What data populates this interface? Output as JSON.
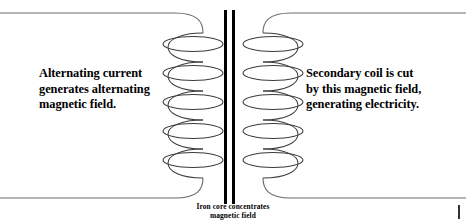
{
  "figure": {
    "type": "transformer-diagram",
    "background_color": "#ffffff",
    "annotations": {
      "primary": {
        "lines": [
          "Alternating current",
          "generates alternating",
          "magnetic field."
        ]
      },
      "secondary": {
        "lines": [
          "Secondary coil is cut",
          "by this magnetic field,",
          "generating electricity."
        ]
      },
      "core_caption": {
        "lines": [
          "Iron core concentrates",
          "magnetic field"
        ]
      }
    },
    "parts": {
      "primary_coil_label": "primary-coil",
      "secondary_coil_label": "secondary-coil",
      "iron_core_label": "iron-core",
      "top_lead_label": "top-wire-lead",
      "bottom_lead_label": "bottom-wire-lead"
    },
    "colors": {
      "wire": "#555555",
      "coil": "#3a3a3a",
      "core": "#000000",
      "text": "#000000",
      "tick": "#333333"
    },
    "geometry": {
      "core_bar_left_x": 224,
      "core_bar_right_x": 232,
      "core_bar_width": 3,
      "core_top_y": 10,
      "core_bottom_y": 204,
      "turns": 6,
      "top_lead_y": 13,
      "bottom_lead_y": 198
    }
  }
}
